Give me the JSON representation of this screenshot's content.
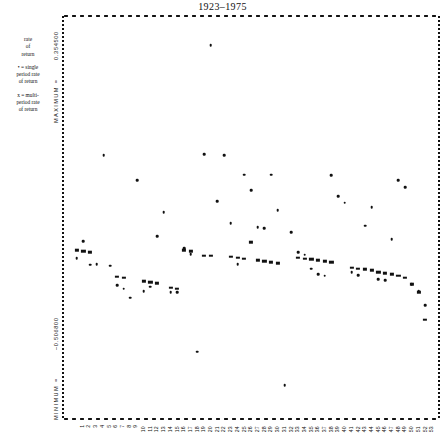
{
  "title": "1923–1975",
  "legend": {
    "heading": [
      "rate",
      "of",
      "return"
    ],
    "entries": [
      [
        "• = single",
        "period rate",
        "of return"
      ],
      [
        "x = multi-",
        "period rate",
        "of return"
      ]
    ]
  },
  "axes": {
    "y_max_value": "0.354500",
    "y_max_label": "MAXIMUM =",
    "y_min_value": "–0.506800",
    "y_min_label": "MINIMUM ="
  },
  "chart_data": {
    "type": "scatter",
    "title": "1923–1975",
    "xlabel": "",
    "ylabel": "rate of return",
    "grid": false,
    "legend_position": "left",
    "xlim": [
      0,
      54
    ],
    "ylim": [
      -0.5068,
      0.3545
    ],
    "xticks": [
      1,
      2,
      3,
      4,
      5,
      6,
      7,
      8,
      9,
      10,
      11,
      12,
      13,
      14,
      15,
      16,
      17,
      18,
      19,
      20,
      21,
      22,
      23,
      24,
      25,
      26,
      27,
      28,
      29,
      30,
      31,
      32,
      33,
      34,
      35,
      36,
      37,
      38,
      39,
      40,
      41,
      42,
      43,
      44,
      45,
      46,
      47,
      48,
      49,
      50,
      51,
      52,
      53
    ],
    "series": [
      {
        "name": "single period rate of return",
        "marker": "dot",
        "points": [
          [
            1,
            -0.165
          ],
          [
            2,
            -0.128
          ],
          [
            3,
            -0.18
          ],
          [
            4,
            -0.178
          ],
          [
            5,
            0.06
          ],
          [
            6,
            -0.182
          ],
          [
            7,
            -0.225
          ],
          [
            8,
            -0.232
          ],
          [
            9,
            -0.252
          ],
          [
            10,
            0.006
          ],
          [
            11,
            -0.238
          ],
          [
            12,
            -0.228
          ],
          [
            13,
            -0.117
          ],
          [
            14,
            -0.064
          ],
          [
            15,
            -0.24
          ],
          [
            16,
            -0.24
          ],
          [
            17,
            -0.144
          ],
          [
            18,
            -0.156
          ],
          [
            19,
            -0.37
          ],
          [
            20,
            0.063
          ],
          [
            21,
            0.302
          ],
          [
            22,
            -0.04
          ],
          [
            23,
            0.06
          ],
          [
            24,
            -0.088
          ],
          [
            25,
            -0.178
          ],
          [
            26,
            0.018
          ],
          [
            27,
            -0.016
          ],
          [
            28,
            -0.098
          ],
          [
            29,
            -0.1
          ],
          [
            30,
            0.018
          ],
          [
            31,
            -0.06
          ],
          [
            32,
            -0.444
          ],
          [
            33,
            -0.108
          ],
          [
            34,
            -0.152
          ],
          [
            35,
            -0.158
          ],
          [
            36,
            -0.188
          ],
          [
            37,
            -0.2
          ],
          [
            38,
            -0.204
          ],
          [
            39,
            0.016
          ],
          [
            40,
            -0.03
          ],
          [
            41,
            -0.044
          ],
          [
            42,
            -0.196
          ],
          [
            43,
            -0.202
          ],
          [
            44,
            -0.094
          ],
          [
            45,
            -0.054
          ],
          [
            46,
            -0.212
          ],
          [
            47,
            -0.214
          ],
          [
            48,
            -0.124
          ],
          [
            49,
            0.006
          ],
          [
            50,
            -0.01
          ],
          [
            51,
            -0.222
          ],
          [
            52,
            -0.238
          ],
          [
            53,
            -0.268
          ]
        ]
      },
      {
        "name": "multi period rate of return",
        "marker": "x",
        "points": [
          [
            1,
            -0.148
          ],
          [
            2,
            -0.15
          ],
          [
            3,
            -0.152
          ],
          [
            7,
            -0.206
          ],
          [
            8,
            -0.208
          ],
          [
            11,
            -0.216
          ],
          [
            12,
            -0.218
          ],
          [
            13,
            -0.22
          ],
          [
            15,
            -0.23
          ],
          [
            16,
            -0.232
          ],
          [
            17,
            -0.148
          ],
          [
            18,
            -0.15
          ],
          [
            20,
            -0.16
          ],
          [
            21,
            -0.16
          ],
          [
            24,
            -0.162
          ],
          [
            25,
            -0.164
          ],
          [
            26,
            -0.166
          ],
          [
            27,
            -0.13
          ],
          [
            28,
            -0.17
          ],
          [
            29,
            -0.172
          ],
          [
            30,
            -0.174
          ],
          [
            31,
            -0.176
          ],
          [
            34,
            -0.164
          ],
          [
            35,
            -0.166
          ],
          [
            36,
            -0.168
          ],
          [
            37,
            -0.17
          ],
          [
            38,
            -0.172
          ],
          [
            39,
            -0.174
          ],
          [
            42,
            -0.186
          ],
          [
            43,
            -0.188
          ],
          [
            44,
            -0.19
          ],
          [
            45,
            -0.192
          ],
          [
            46,
            -0.196
          ],
          [
            47,
            -0.198
          ],
          [
            48,
            -0.2
          ],
          [
            49,
            -0.204
          ],
          [
            50,
            -0.208
          ],
          [
            51,
            -0.222
          ],
          [
            52,
            -0.24
          ],
          [
            53,
            -0.3
          ]
        ]
      }
    ],
    "annotations": []
  }
}
